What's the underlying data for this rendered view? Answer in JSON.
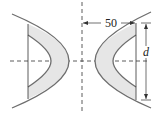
{
  "diagram": {
    "dimensions": {
      "horizontal_label": "50",
      "vertical_label": "d"
    },
    "colors": {
      "stroke": "#6e6e6e",
      "fill": "#e6e6e6",
      "line": "#333333"
    }
  }
}
